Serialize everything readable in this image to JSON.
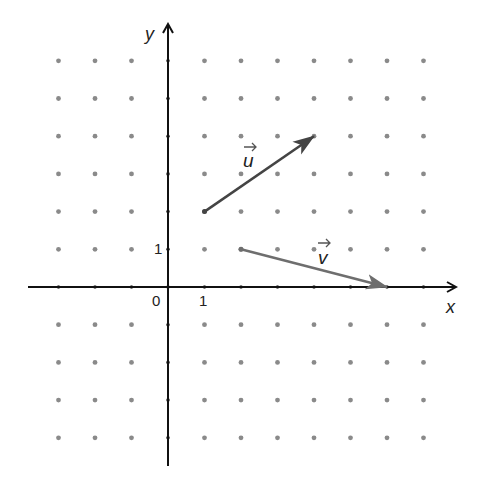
{
  "diagram": {
    "type": "coordinate-grid-vectors",
    "grid": {
      "origin_px": [
        168,
        287
      ],
      "spacing_px": [
        36.5,
        37.7
      ],
      "x_range": [
        -3,
        7
      ],
      "y_range": [
        -4,
        6
      ],
      "dot_color": "#8a8a8a"
    },
    "axes": {
      "x_label": "x",
      "y_label": "y",
      "origin_label": "0",
      "x_tick_label": "1",
      "y_tick_label": "1",
      "color": "#111111"
    },
    "vectors": [
      {
        "name": "u",
        "label": "u",
        "start": [
          1,
          2
        ],
        "end": [
          4,
          4
        ],
        "color": "#444444"
      },
      {
        "name": "v",
        "label": "v",
        "start": [
          2,
          1
        ],
        "end": [
          6,
          0
        ],
        "color": "#6e6e6e"
      }
    ]
  }
}
